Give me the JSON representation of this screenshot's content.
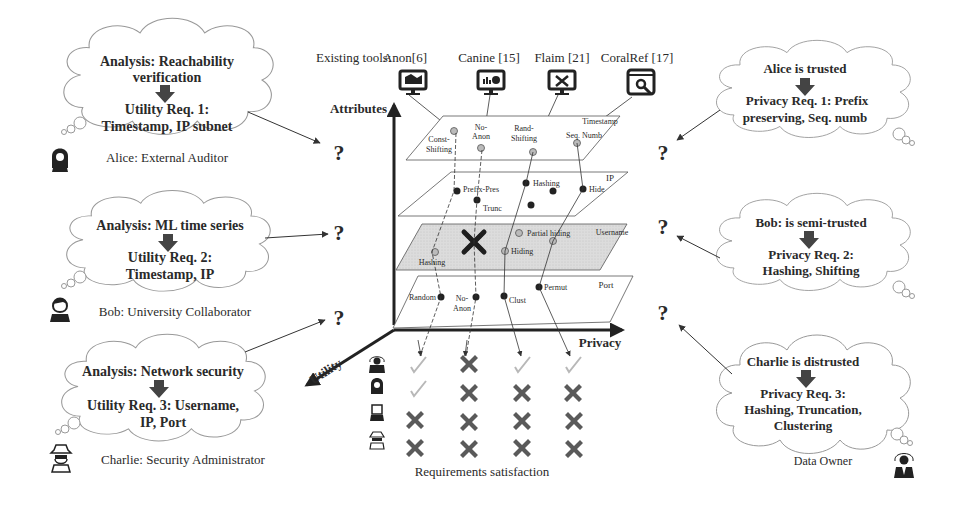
{
  "tools": {
    "label": "Existing tools:",
    "items": [
      {
        "name": "Anon[6]",
        "icon": "monitor-gear-icon"
      },
      {
        "name": "Canine [15]",
        "icon": "monitor-chart-icon"
      },
      {
        "name": "Flaim [21]",
        "icon": "monitor-tools-icon"
      },
      {
        "name": "CoralRef [17]",
        "icon": "window-wrench-icon"
      }
    ]
  },
  "axes": {
    "attributes": "Attributes",
    "privacy": "Privacy",
    "utility": "Utility"
  },
  "planes": [
    {
      "name": "Timestamp",
      "methods": [
        "Const-",
        "Shifting",
        "No-",
        "Anon",
        "Rand-",
        "Shifting",
        "Seq. Numb"
      ]
    },
    {
      "name": "IP",
      "methods": [
        "Prefix-Pres",
        "Trunc",
        "Hashing",
        "Hide"
      ]
    },
    {
      "name": "Username",
      "methods": [
        "Hashing",
        "Partial hiding",
        "Hiding"
      ]
    },
    {
      "name": "Port",
      "methods": [
        "Random",
        "No-",
        "Anon",
        "Clust",
        "Permut"
      ]
    }
  ],
  "users": {
    "alice": {
      "analysis": "Analysis: Reachability",
      "analysis2": "verification",
      "req": "Utility Req. 1:",
      "req2": "Timestamp, IP subnet",
      "caption": "Alice: External Auditor"
    },
    "bob": {
      "analysis": "Analysis: ML time series",
      "req": "Utility Req. 2:",
      "req2": "Timestamp, IP",
      "caption": "Bob: University Collaborator"
    },
    "charlie": {
      "analysis": "Analysis: Network security",
      "req": "Utility Req. 3: Username,",
      "req2": "IP, Port",
      "caption": "Charlie: Security Administrator"
    }
  },
  "owner": {
    "alice": {
      "trust": "Alice is trusted",
      "req": "Privacy Req. 1: Prefix",
      "req2": "preserving,  Seq. numb"
    },
    "bob": {
      "trust": "Bob: is semi-trusted",
      "req": "Privacy Req. 2:",
      "req2": "Hashing, Shifting"
    },
    "charlie": {
      "trust": "Charlie is distrusted",
      "req": "Privacy Req. 3:",
      "req2": "Hashing, Truncation,",
      "req3": "Clustering"
    },
    "caption": "Data Owner"
  },
  "unknown_mark": "?",
  "matrix": {
    "caption": "Requirements satisfaction",
    "rows": [
      {
        "who": "Data Owner",
        "cells": [
          "check",
          "cross",
          "check",
          "check"
        ]
      },
      {
        "who": "Alice",
        "cells": [
          "check",
          "cross",
          "cross",
          "cross"
        ]
      },
      {
        "who": "Bob",
        "cells": [
          "cross",
          "cross",
          "cross",
          "cross"
        ]
      },
      {
        "who": "Charlie",
        "cells": [
          "cross",
          "cross",
          "cross",
          "cross"
        ]
      }
    ]
  },
  "colors": {
    "check": "#b5b5b5",
    "cross": "#555555",
    "plane_shade": "#d9d9d9"
  }
}
